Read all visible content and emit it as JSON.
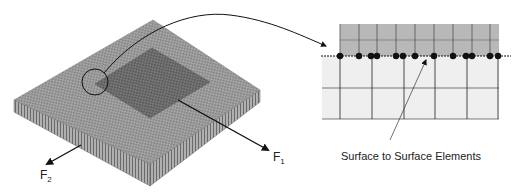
{
  "figure": {
    "left_panel": {
      "plate": "meshed-base-plate",
      "patch": "meshed-square-patch",
      "callout": "magnifier-circle",
      "forces": [
        {
          "name": "F",
          "subscript": "1"
        },
        {
          "name": "F",
          "subscript": "2"
        }
      ]
    },
    "right_panel": {
      "detail": "cross-section-mesh-detail",
      "caption": "Surface to Surface Elements",
      "contact_node_count": 15
    },
    "colors": {
      "plate": "#9a9a9a",
      "patch": "#6e6e6e",
      "detail_top": "#b8b8b8",
      "detail_bottom": "#efefef",
      "lines": "#111111"
    }
  }
}
